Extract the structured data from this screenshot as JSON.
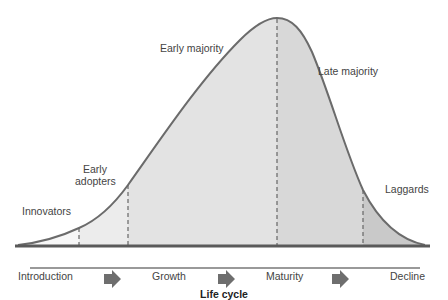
{
  "diagram": {
    "segments": [
      {
        "label_lines": [
          "Innovators"
        ],
        "fill": "#f7f7f7"
      },
      {
        "label_lines": [
          "Early",
          "adopters"
        ],
        "fill": "#ececec"
      },
      {
        "label_lines": [
          "Early majority"
        ],
        "fill": "#e3e3e3"
      },
      {
        "label_lines": [
          "Late majority"
        ],
        "fill": "#d8d8d8"
      },
      {
        "label_lines": [
          "Laggards"
        ],
        "fill": "#c9c9c9"
      }
    ],
    "stages": [
      "Introduction",
      "Growth",
      "Maturity",
      "Decline"
    ],
    "axis_label": "Life cycle",
    "colors": {
      "curve": "#6b6b6b",
      "baseline": "#5a5a5a",
      "divider": "#666666",
      "arrow": "#6e6e6e"
    }
  }
}
